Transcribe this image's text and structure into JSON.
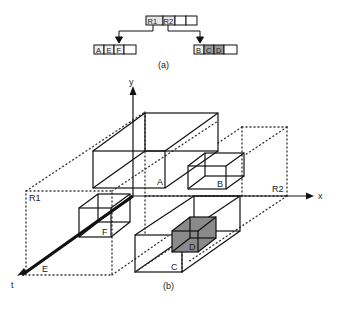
{
  "part_a": {
    "caption": "(a)",
    "root_node": {
      "cells": [
        "R1",
        "R2",
        "",
        ""
      ]
    },
    "left_child": {
      "cells": [
        "A",
        "E",
        "F",
        ""
      ],
      "shaded": [
        false,
        false,
        false,
        false
      ]
    },
    "right_child": {
      "cells": [
        "B",
        "C",
        "D",
        ""
      ],
      "shaded": [
        false,
        true,
        true,
        false
      ]
    }
  },
  "part_b": {
    "caption": "(b)",
    "axes": {
      "x": "x",
      "y": "y",
      "t": "t"
    },
    "regions": {
      "r1": "R1",
      "r2": "R2"
    },
    "objects": {
      "a": "A",
      "b": "B",
      "c": "C",
      "d": "D",
      "e": "E",
      "f": "F"
    },
    "colors": {
      "line": "#111111",
      "shaded_box": "#8a8a8a"
    }
  }
}
